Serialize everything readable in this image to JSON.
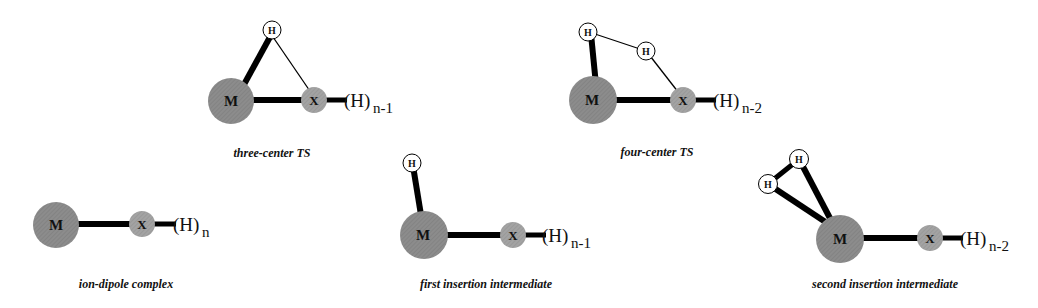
{
  "figure": {
    "colors": {
      "metal": "#8a8a8a",
      "x_atom": "#a0a0a0",
      "h_atom": "#ffffff",
      "bond": "#000000"
    },
    "structures": [
      {
        "id": "three-center-ts",
        "caption": "three-center TS",
        "metal": "M",
        "x": "X",
        "h_labels": [
          "H"
        ],
        "group": "(H)",
        "subscript": "n-1"
      },
      {
        "id": "four-center-ts",
        "caption": "four-center TS",
        "metal": "M",
        "x": "X",
        "h_labels": [
          "H",
          "H"
        ],
        "group": "(H)",
        "subscript": "n-2"
      },
      {
        "id": "ion-dipole-complex",
        "caption": "ion-dipole complex",
        "metal": "M",
        "x": "X",
        "h_labels": [],
        "group": "(H)",
        "subscript": "n"
      },
      {
        "id": "first-insertion-intermediate",
        "caption": "first insertion intermediate",
        "metal": "M",
        "x": "X",
        "h_labels": [
          "H"
        ],
        "group": "(H)",
        "subscript": "n-1"
      },
      {
        "id": "second-insertion-intermediate",
        "caption": "second insertion intermediate",
        "metal": "M",
        "x": "X",
        "h_labels": [
          "H",
          "H"
        ],
        "group": "(H)",
        "subscript": "n-2"
      }
    ]
  }
}
